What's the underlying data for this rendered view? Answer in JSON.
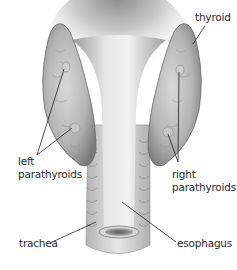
{
  "diagram": {
    "labels": {
      "thyroid": "thyroid",
      "left_parathyroids_line1": "left",
      "left_parathyroids_line2": "parathyroids",
      "right_parathyroids_line1": "right",
      "right_parathyroids_line2": "parathyroids",
      "trachea": "trachea",
      "esophagus": "esophagus"
    },
    "colors": {
      "background": "#ffffff",
      "tissue_light": "#dcdcdc",
      "tissue_mid": "#a8a8a8",
      "tissue_dark": "#6e6e6e",
      "leader_line": "#222222",
      "text": "#2a2a2a"
    }
  }
}
